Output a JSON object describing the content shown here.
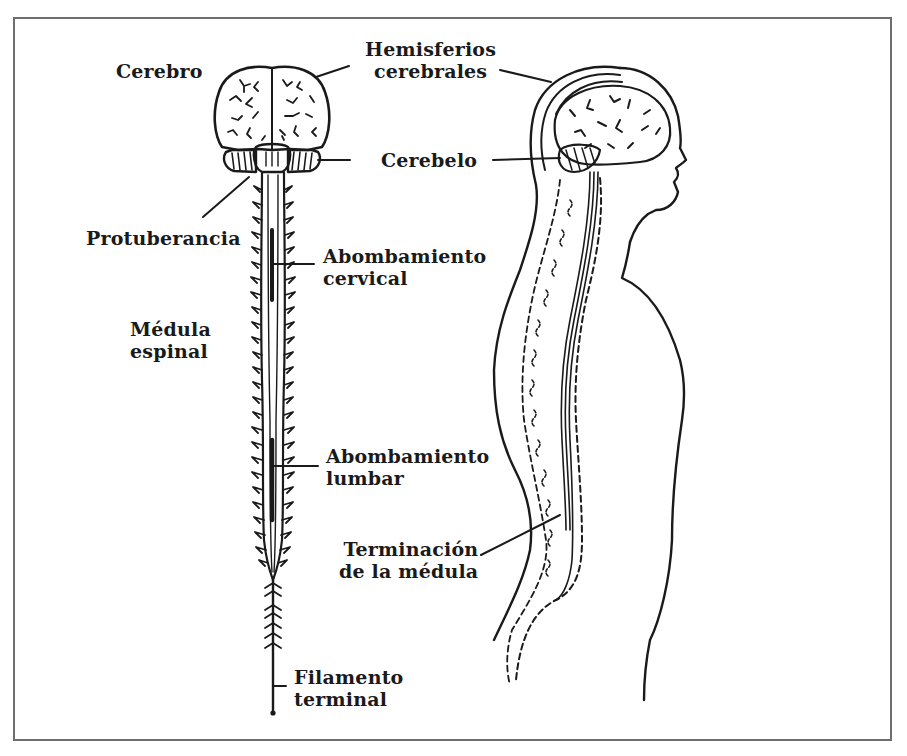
{
  "diagram": {
    "type": "anatomical-illustration",
    "colors": {
      "ink": "#1a1a1a",
      "frame": "#6e6e6e",
      "background": "#ffffff"
    },
    "labels": {
      "cerebro": {
        "line1": "Cerebro"
      },
      "hemisferios": {
        "line1": "Hemisferios",
        "line2": "cerebrales"
      },
      "cerebelo": {
        "line1": "Cerebelo"
      },
      "protuberancia": {
        "line1": "Protuberancia"
      },
      "abombamiento_cervical": {
        "line1": "Abombamiento",
        "line2": "cervical"
      },
      "medula_espinal": {
        "line1": "Médula",
        "line2": "espinal"
      },
      "abombamiento_lumbar": {
        "line1": "Abombamiento",
        "line2": "lumbar"
      },
      "terminacion": {
        "line1": "Terminación",
        "line2": "de la médula"
      },
      "filamento": {
        "line1": "Filamento",
        "line2": "terminal"
      }
    },
    "figures": [
      {
        "name": "front-view",
        "description": "Vista frontal del encéfalo y la médula espinal"
      },
      {
        "name": "side-view",
        "description": "Vista lateral de la cabeza y el torso con la columna"
      }
    ]
  }
}
